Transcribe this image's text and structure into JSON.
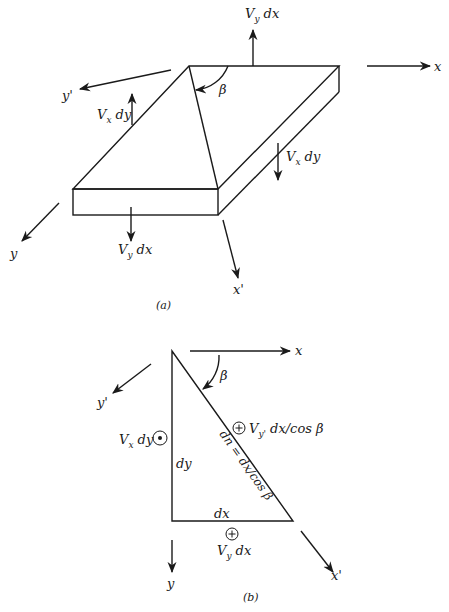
{
  "figure_a": {
    "caption": "(a)",
    "axes": {
      "x": "x",
      "y": "y",
      "x_prime": "x'",
      "y_prime": "y'"
    },
    "angle": "β",
    "forces": {
      "vy_dx_top": {
        "V": "V",
        "sub": "y",
        "rest": " dx"
      },
      "vx_dy_left": {
        "V": "V",
        "sub": "x",
        "rest": " dy"
      },
      "vx_dy_right": {
        "V": "V",
        "sub": "x",
        "rest": " dy"
      },
      "vy_dx_bottom": {
        "V": "V",
        "sub": "y",
        "rest": " dx"
      }
    }
  },
  "figure_b": {
    "caption": "(b)",
    "axes": {
      "x": "x",
      "y": "y",
      "x_prime": "x'",
      "y_prime": "y'"
    },
    "angle": "β",
    "sides": {
      "dy": "dy",
      "dx": "dx",
      "hyp": "dn = dx/cos β"
    },
    "forces": {
      "vx_dy": {
        "V": "V",
        "sub": "x",
        "rest": " dy",
        "symbol": "dot"
      },
      "vyp": {
        "V": "V",
        "sub": "y'",
        "rest": " dx/cos β",
        "symbol": "plus"
      },
      "vy_dx": {
        "V": "V",
        "sub": "y",
        "rest": " dx",
        "symbol": "plus"
      }
    }
  }
}
